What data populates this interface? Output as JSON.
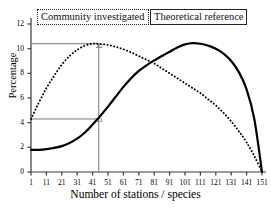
{
  "chart_data": {
    "type": "line",
    "title": "",
    "xlabel": "Number of stations / species",
    "ylabel": "Percentage",
    "xlim": [
      1,
      151
    ],
    "ylim": [
      0,
      12
    ],
    "grid": false,
    "legend_position": "top",
    "xticks": [
      1,
      11,
      21,
      31,
      41,
      51,
      61,
      71,
      81,
      91,
      101,
      111,
      121,
      131,
      141,
      151
    ],
    "yticks": [
      0,
      2,
      4,
      6,
      8,
      10,
      12
    ],
    "series": [
      {
        "name": "Community investigated",
        "style": "dotted",
        "x": [
          1,
          6,
          11,
          16,
          21,
          26,
          31,
          36,
          41,
          45,
          51,
          56,
          61,
          66,
          71,
          76,
          81,
          86,
          91,
          96,
          101,
          106,
          111,
          116,
          121,
          126,
          131,
          136,
          141,
          146,
          151
        ],
        "y": [
          4.3,
          5.6,
          6.8,
          7.8,
          8.7,
          9.4,
          9.9,
          10.25,
          10.4,
          10.4,
          10.3,
          10.15,
          9.95,
          9.7,
          9.4,
          9.1,
          8.8,
          8.4,
          8.0,
          7.6,
          7.2,
          6.8,
          6.4,
          5.9,
          5.4,
          4.8,
          4.1,
          3.3,
          2.4,
          1.3,
          0.0
        ]
      },
      {
        "name": "Theoretical reference",
        "style": "solid",
        "x": [
          1,
          6,
          11,
          16,
          21,
          26,
          31,
          36,
          41,
          45,
          51,
          56,
          61,
          66,
          71,
          76,
          81,
          86,
          91,
          96,
          101,
          106,
          111,
          116,
          121,
          126,
          131,
          136,
          141,
          146,
          151
        ],
        "y": [
          1.8,
          1.8,
          1.85,
          1.95,
          2.1,
          2.35,
          2.7,
          3.2,
          3.85,
          4.4,
          5.3,
          6.1,
          6.9,
          7.6,
          8.2,
          8.65,
          9.05,
          9.4,
          9.75,
          10.1,
          10.35,
          10.45,
          10.4,
          10.25,
          10.0,
          9.6,
          9.0,
          8.1,
          6.7,
          4.3,
          0.0
        ]
      }
    ],
    "annotations": [
      {
        "label": "Z2",
        "kind": "reference-intersection",
        "x": 45,
        "y": 10.4
      },
      {
        "label": "Z1",
        "kind": "reference-intersection",
        "x": 45,
        "y": 4.3
      }
    ],
    "reference_lines": {
      "vertical_x": 45,
      "horizontal_y": [
        10.4,
        4.3
      ]
    }
  },
  "legend": {
    "community": "Community investigated",
    "theoretical": "Theoretical reference"
  },
  "axes": {
    "y_title": "Percentage",
    "x_title": "Number of stations / species",
    "y_tick_labels": [
      "0",
      "2",
      "4",
      "6",
      "8",
      "10",
      "12"
    ],
    "x_tick_labels": [
      "1",
      "11",
      "21",
      "31",
      "41",
      "51",
      "61",
      "71",
      "81",
      "91",
      "101",
      "111",
      "121",
      "131",
      "141",
      "151"
    ]
  },
  "annotation_labels": {
    "z1": "Z1",
    "z2": "Z2"
  },
  "colors": {
    "curve": "#000000",
    "axis": "#3a3a3a",
    "reference_line": "#777777",
    "background": "#ffffff"
  }
}
